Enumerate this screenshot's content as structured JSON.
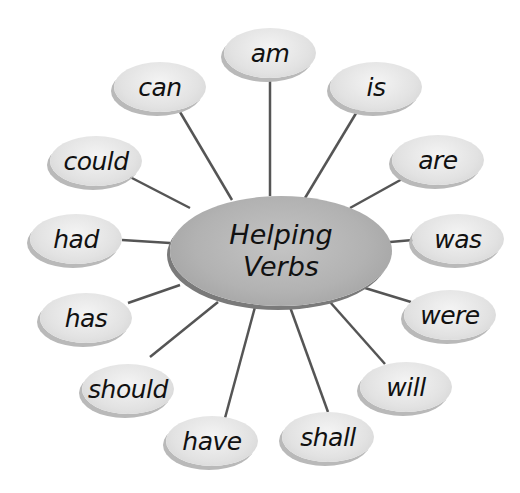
{
  "diagram": {
    "center": {
      "line1": "Helping",
      "line2": "Verbs"
    },
    "nodes": [
      {
        "label": "am"
      },
      {
        "label": "is"
      },
      {
        "label": "are"
      },
      {
        "label": "was"
      },
      {
        "label": "were"
      },
      {
        "label": "will"
      },
      {
        "label": "shall"
      },
      {
        "label": "have"
      },
      {
        "label": "should"
      },
      {
        "label": "has"
      },
      {
        "label": "had"
      },
      {
        "label": "could"
      },
      {
        "label": "can"
      }
    ]
  }
}
